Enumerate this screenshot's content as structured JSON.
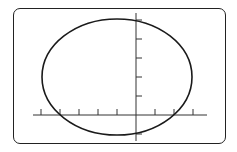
{
  "screen": {
    "description": "Graphing calculator screen showing an ellipse on coordinate axes",
    "frame_color": "#222222",
    "curve_color": "#1a1a1a",
    "axis_color": "#333333"
  },
  "graph": {
    "origin_px": {
      "x": 136,
      "y": 115
    },
    "tick_spacing_px": 19,
    "x_ticks_left": 5,
    "x_ticks_right": 3,
    "y_ticks_up": 5,
    "y_ticks_down": 1,
    "ellipse": {
      "center_units": {
        "x": -1,
        "y": 2
      },
      "rx_units": 4,
      "ry_units": 3
    }
  }
}
